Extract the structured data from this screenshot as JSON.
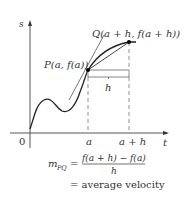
{
  "diagram": {
    "axes": {
      "y_label": "s",
      "x_label": "t",
      "origin_label": "0"
    },
    "points": {
      "P": {
        "label": "P(a, f(a))"
      },
      "Q": {
        "label": "Q(a + h, f(a + h))"
      }
    },
    "x_ticks": [
      "a",
      "a + h"
    ],
    "interval_label": "h",
    "formula": {
      "lhs_main": "m",
      "lhs_sub": "PQ",
      "equals": "=",
      "numerator": "f(a + h) − f(a)",
      "denominator": "h",
      "second_line": "= average velocity"
    },
    "colors": {
      "stroke": "#333333",
      "dashed": "#777777",
      "point": "#000000"
    }
  }
}
